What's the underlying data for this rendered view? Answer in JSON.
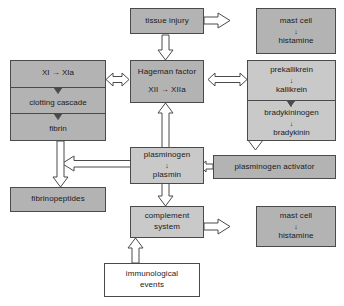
{
  "diagram": {
    "colors": {
      "box_fill_dark": "#b3b3b3",
      "box_fill_light": "#c9c9c9",
      "box_fill_white": "#ffffff",
      "stroke": "#4a4a4a",
      "text": "#1a1a1a",
      "background": "#ffffff"
    },
    "nodes": {
      "tissue_injury": {
        "label": "tissue injury"
      },
      "mast_cell_top": {
        "line1": "mast cell",
        "line2": "histamine",
        "arrow": "↓"
      },
      "mast_cell_bottom": {
        "line1": "mast cell",
        "line2": "histamine",
        "arrow": "↓"
      },
      "hageman_factor": {
        "line1": "Hageman factor",
        "line2": "XII → XIIa"
      },
      "clotting_stack": {
        "cells": [
          {
            "label": "XI → XIa"
          },
          {
            "label": "clotting cascade"
          },
          {
            "label": "fibrin"
          }
        ]
      },
      "kallikrein_stack": {
        "cells": [
          {
            "line1": "prekallikrein",
            "arrow": "↓",
            "line2": "kallikrein"
          },
          {
            "line1": "bradykininogen",
            "arrow": "↓",
            "line2": "bradykinin"
          }
        ]
      },
      "plasminogen": {
        "line1": "plasminogen",
        "arrow": "↓",
        "line2": "plasmin"
      },
      "plasminogen_activator": {
        "label": "plasminogen activator"
      },
      "fibrinopeptides": {
        "label": "fibrinopeptides"
      },
      "complement_system": {
        "line1": "complement",
        "line2": "system"
      },
      "immunological_events": {
        "line1": "immunological",
        "line2": "events"
      }
    },
    "edges": [
      {
        "from": "tissue_injury",
        "to": "mast_cell_top",
        "style": "hollow-right"
      },
      {
        "from": "tissue_injury",
        "to": "hageman_factor",
        "style": "hollow-down"
      },
      {
        "from": "hageman_factor",
        "to": "clotting_stack",
        "style": "hollow-double-left"
      },
      {
        "from": "hageman_factor",
        "to": "kallikrein_stack",
        "style": "hollow-double-right"
      },
      {
        "from": "plasminogen",
        "to": "hageman_factor",
        "style": "hollow-up"
      },
      {
        "from": "kallikrein_stack",
        "to": "plasminogen_activator",
        "style": "hollow-down-long"
      },
      {
        "from": "plasminogen_activator",
        "to": "plasminogen",
        "style": "hollow-left-small"
      },
      {
        "from": "plasminogen",
        "to": "fibrinopeptides",
        "style": "hollow-left-then-down"
      },
      {
        "from": "clotting_stack",
        "to": "fibrinopeptides",
        "style": "hollow-down"
      },
      {
        "from": "plasminogen",
        "to": "complement_system",
        "style": "hollow-down"
      },
      {
        "from": "complement_system",
        "to": "mast_cell_bottom",
        "style": "hollow-right"
      },
      {
        "from": "immunological_events",
        "to": "complement_system",
        "style": "hollow-up"
      }
    ]
  }
}
